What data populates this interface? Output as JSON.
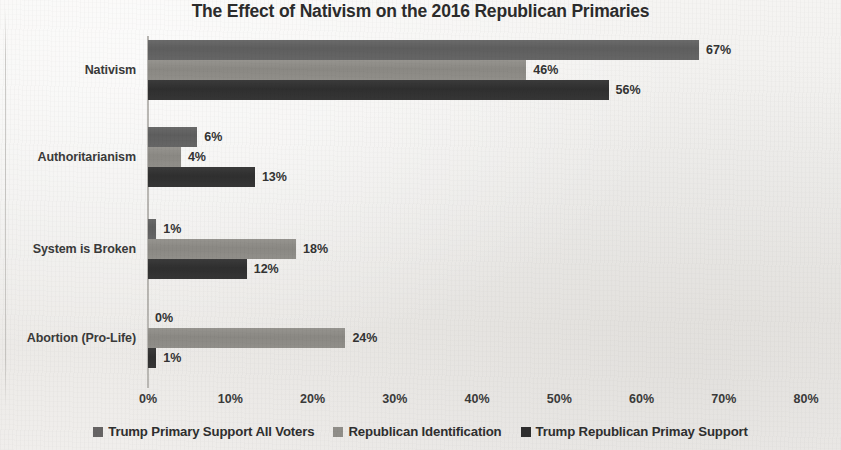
{
  "chart_data": {
    "type": "bar",
    "orientation": "horizontal",
    "title": "The Effect of Nativism on the 2016 Republican Primaries",
    "xlabel": "",
    "ylabel": "",
    "xlim": [
      0,
      80
    ],
    "grid": false,
    "legend_position": "bottom",
    "categories": [
      "Nativism",
      "Authoritarianism",
      "System is Broken",
      "Abortion (Pro-Life)"
    ],
    "xtick_labels": [
      "0%",
      "10%",
      "20%",
      "30%",
      "40%",
      "50%",
      "60%",
      "70%",
      "80%"
    ],
    "xtick_values": [
      0,
      10,
      20,
      30,
      40,
      50,
      60,
      70,
      80
    ],
    "series": [
      {
        "name": "Trump Primary Support All Voters",
        "color": "#666464",
        "values": [
          67,
          6,
          1,
          0
        ],
        "labels": [
          "67%",
          "6%",
          "1%",
          "0%"
        ]
      },
      {
        "name": "Republican Identification",
        "color": "#908e89",
        "values": [
          46,
          4,
          18,
          24
        ],
        "labels": [
          "46%",
          "4%",
          "18%",
          "24%"
        ]
      },
      {
        "name": "Trump Republican Primay Support",
        "color": "#2e2e2e",
        "values": [
          56,
          13,
          12,
          1
        ],
        "labels": [
          "56%",
          "13%",
          "12%",
          "1%"
        ]
      }
    ]
  }
}
